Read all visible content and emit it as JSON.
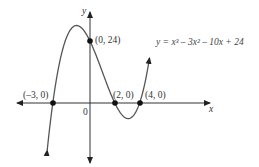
{
  "chart_data": {
    "type": "line",
    "title": "",
    "equation": "y = x³ – 3x² – 10x + 24",
    "xlabel": "x",
    "ylabel": "y",
    "origin_label": "0",
    "xlim": [
      -3.6,
      5.4
    ],
    "ylim": [
      -24,
      39
    ],
    "grid": false,
    "legend": "none",
    "series": [
      {
        "name": "y = x³ – 3x² – 10x + 24",
        "x": [
          -3.4,
          -3,
          -2,
          -1,
          0,
          1,
          2,
          3,
          4,
          4.8
        ],
        "y": [
          -9.9,
          0,
          24,
          30,
          24,
          12,
          0,
          -6,
          0,
          19.1
        ]
      }
    ],
    "annotations": [
      {
        "label": "(–3, 0)",
        "x": -3,
        "y": 0
      },
      {
        "label": "(0, 24)",
        "x": 0,
        "y": 24
      },
      {
        "label": "(2, 0)",
        "x": 2,
        "y": 0
      },
      {
        "label": "(4, 0)",
        "x": 4,
        "y": 0
      }
    ]
  },
  "labels": {
    "y_axis": "y",
    "x_axis": "x",
    "origin": "0",
    "p1": "(–3, 0)",
    "p2": "(0, 24)",
    "p3": "(2, 0)",
    "p4": "(4, 0)",
    "equation": "y = x³ – 3x² – 10x + 24"
  }
}
